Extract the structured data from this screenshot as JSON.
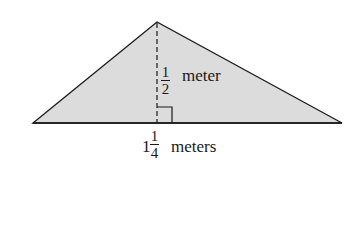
{
  "diagram": {
    "type": "triangle",
    "fill_color": "#dcdcdc",
    "stroke_color": "#1a1a1a",
    "vertices": {
      "left": [
        33,
        123
      ],
      "apex": [
        157,
        22
      ],
      "right": [
        342,
        123
      ]
    },
    "height_line": "dashed",
    "right_angle_marker": true
  },
  "height_label": {
    "numerator": "1",
    "denominator": "2",
    "unit": "meter"
  },
  "base_label": {
    "whole": "1",
    "numerator": "1",
    "denominator": "4",
    "unit": "meters"
  }
}
